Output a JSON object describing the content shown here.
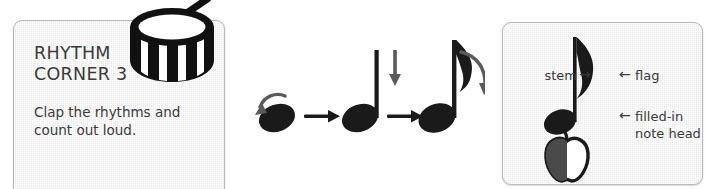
{
  "page": {
    "background_color": "#ffffff",
    "width": 720,
    "height": 189
  },
  "left_panel": {
    "title": "RHYTHM\nCORNER 3",
    "body": "Clap the rhythms and\ncount out loud.",
    "icon": "drum-icon",
    "background_color": "#f1f1f1",
    "border_color": "#b9b9b9",
    "text_color": "#3a3a3a"
  },
  "note_sequence": {
    "caption": "",
    "steps": [
      {
        "name": "note-head",
        "label": "",
        "annotation_arrow": "curved-arrow-to-note-head"
      },
      {
        "name": "quarter-note",
        "label": "",
        "annotation_arrow": "down-arrow-to-stem"
      },
      {
        "name": "eighth-note",
        "label": "",
        "annotation_arrow": "curved-arrow-to-flag"
      }
    ],
    "connectors": [
      "right-arrow",
      "right-arrow"
    ],
    "ink_color": "#1a1a1a"
  },
  "right_panel": {
    "background_color": "#f1f1f1",
    "border_color": "#b9b9b9",
    "text_color": "#3a3a3a",
    "annotations": {
      "stem": "stem",
      "stem_arrow": "→",
      "flag": "flag",
      "flag_arrow": "←",
      "note_head": "filled-in\nnote head",
      "note_head_arrow": "←"
    },
    "figure": "eighth-note",
    "icon": "apple-icon"
  }
}
